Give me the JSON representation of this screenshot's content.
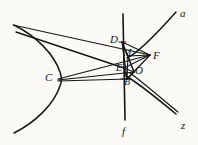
{
  "figure": {
    "type": "geometry-diagram",
    "background_color": "#fbfaf7",
    "stroke_color": "#161616",
    "canvas": {
      "width": 198,
      "height": 145
    },
    "labels": [
      {
        "id": "label-a",
        "text": "a",
        "x": 180,
        "y": 8,
        "size": "normal"
      },
      {
        "id": "label-z",
        "text": "z",
        "x": 181,
        "y": 120,
        "size": "normal"
      },
      {
        "id": "label-f",
        "text": "f",
        "x": 122,
        "y": 126,
        "size": "normal"
      },
      {
        "id": "label-C",
        "text": "C",
        "x": 45,
        "y": 72,
        "size": "normal"
      },
      {
        "id": "label-D",
        "text": "D",
        "x": 110,
        "y": 34,
        "size": "normal"
      },
      {
        "id": "label-M",
        "text": "M",
        "x": 123,
        "y": 48,
        "size": "small"
      },
      {
        "id": "label-F",
        "text": "F",
        "x": 153,
        "y": 50,
        "size": "normal"
      },
      {
        "id": "label-E",
        "text": "E",
        "x": 116,
        "y": 63,
        "size": "small"
      },
      {
        "id": "label-O",
        "text": "O",
        "x": 135,
        "y": 65,
        "size": "normal"
      },
      {
        "id": "label-B",
        "text": "B",
        "x": 124,
        "y": 77,
        "size": "small"
      }
    ],
    "points": {
      "C": {
        "x": 56,
        "y": 78
      },
      "D": {
        "x": 122,
        "y": 42
      },
      "M": {
        "x": 128,
        "y": 56
      },
      "E": {
        "x": 124,
        "y": 68
      },
      "B": {
        "x": 127,
        "y": 79
      },
      "O": {
        "x": 133,
        "y": 72
      },
      "F": {
        "x": 150,
        "y": 55
      }
    },
    "strokes": {
      "line_f": {
        "x1": 123,
        "y1": 14,
        "x2": 125,
        "y2": 120
      },
      "ray_a": {
        "from": "M",
        "to": {
          "x": 176,
          "y": 12
        }
      },
      "ray_z": {
        "from": "B",
        "to": {
          "x": 176,
          "y": 114
        }
      }
    }
  }
}
